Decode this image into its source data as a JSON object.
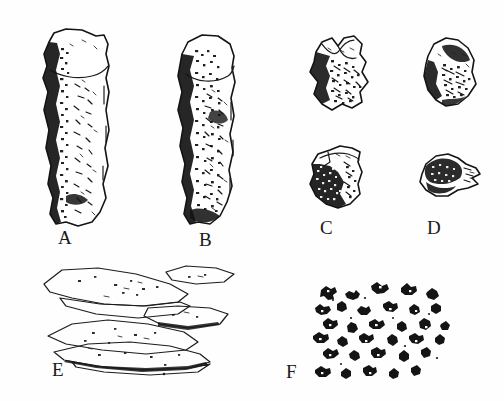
{
  "plate": {
    "title": "Specimen plate A-F",
    "background_color": "#fefefe",
    "ink_color": "#141414",
    "width": 504,
    "height": 401
  },
  "labels": {
    "a": "A",
    "b": "B",
    "c": "C",
    "d": "D",
    "e": "E",
    "f": "F"
  },
  "figures": [
    {
      "id": "a",
      "label": "A",
      "name": "elongated-blade-specimen-a",
      "description": "Tall columnar stone blade, light face with dark stippled cortex along left edge",
      "orientation": "vertical"
    },
    {
      "id": "b",
      "label": "B",
      "name": "elongated-blade-specimen-b",
      "description": "Tall columnar stone blade, heavily stippled surface with dark cortex on left edge",
      "orientation": "vertical"
    },
    {
      "id": "c1",
      "label": "C",
      "name": "angular-fragment-c-upper",
      "description": "Angular rock fragment, upper of the C pair",
      "orientation": "irregular"
    },
    {
      "id": "c2",
      "label": "C",
      "name": "angular-fragment-c-lower",
      "description": "Angular rock fragment with dark stipple, lower of the C pair, carries the C label",
      "orientation": "irregular"
    },
    {
      "id": "d1",
      "label": "D",
      "name": "angular-fragment-d-upper",
      "description": "Rounded rock fragment, upper of the D pair",
      "orientation": "irregular"
    },
    {
      "id": "d2",
      "label": "D",
      "name": "angular-fragment-d-lower",
      "description": "Small rounded fragment with tapered right point, lower of the D pair, carries the D label",
      "orientation": "irregular"
    },
    {
      "id": "e",
      "label": "E",
      "name": "stacked-flakes-specimen-e",
      "description": "Group of overlapping thin flat flakes drawn in outline",
      "orientation": "horizontal-stack"
    },
    {
      "id": "f",
      "label": "F",
      "name": "scattered-grains-specimen-f",
      "description": "Scatter of many small dark angular grains",
      "orientation": "scatter"
    }
  ]
}
